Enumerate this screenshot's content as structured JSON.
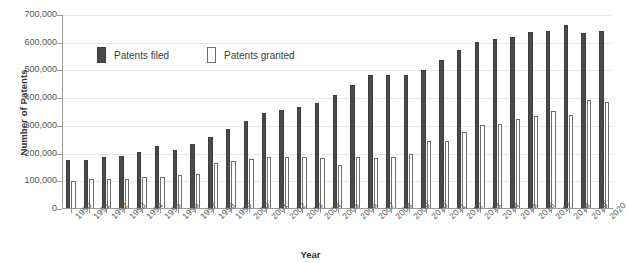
{
  "chart_data": {
    "type": "bar",
    "title": "",
    "xlabel": "Year",
    "ylabel": "Number of Patents",
    "ylim": [
      0,
      700000
    ],
    "ytick_labels": [
      "700,000",
      "600,000",
      "500,000",
      "400,000",
      "300,000",
      "200,000",
      "100,000",
      "0"
    ],
    "ytick_values": [
      700000,
      600000,
      500000,
      400000,
      300000,
      200000,
      100000,
      0
    ],
    "grid": true,
    "legend_position": "inside-top-left",
    "categories": [
      "1990",
      "1991",
      "1992",
      "1993",
      "1994",
      "1995",
      "1996",
      "1997",
      "1998",
      "1999",
      "2000",
      "2001",
      "2002",
      "2003",
      "2004",
      "2005",
      "2006",
      "2007",
      "2008",
      "2009",
      "2010",
      "2011",
      "2012",
      "2013",
      "2014",
      "2015",
      "2016",
      "2017",
      "2018",
      "2019",
      "2020"
    ],
    "series": [
      {
        "name": "Patents filed",
        "color": "#4a4a4a",
        "values": [
          176000,
          178000,
          187000,
          190000,
          206000,
          229000,
          212000,
          233000,
          261000,
          289000,
          316000,
          345000,
          357000,
          367000,
          382000,
          412000,
          448000,
          485000,
          485000,
          483000,
          503000,
          536000,
          572000,
          601000,
          615000,
          620000,
          640000,
          643000,
          665000,
          635000,
          641000
        ]
      },
      {
        "name": "Patents granted",
        "color": "#ffffff",
        "values": [
          100000,
          107000,
          108000,
          110000,
          114000,
          115000,
          124000,
          125000,
          166000,
          175000,
          182000,
          187000,
          186000,
          189000,
          183000,
          158000,
          186000,
          185000,
          187000,
          200000,
          246000,
          245000,
          277000,
          302000,
          308000,
          325000,
          335000,
          353000,
          340000,
          392000,
          385000
        ]
      }
    ]
  },
  "legend": {
    "filed_label": "Patents filed",
    "granted_label": "Patents granted"
  }
}
